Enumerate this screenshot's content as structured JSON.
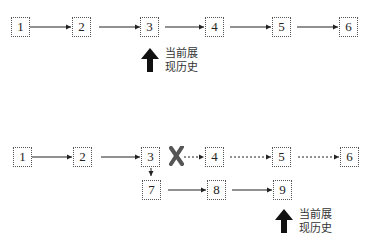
{
  "diagram": {
    "top_row": {
      "nodes": [
        "1",
        "2",
        "3",
        "4",
        "5",
        "6"
      ],
      "current_marker": {
        "node": "3",
        "label_line1": "当前展",
        "label_line2": "现历史"
      }
    },
    "bottom_section": {
      "main_row_nodes": [
        "1",
        "2",
        "3",
        "4",
        "5",
        "6"
      ],
      "discarded_nodes": [
        "4",
        "5",
        "6"
      ],
      "branch_nodes": [
        "7",
        "8",
        "9"
      ],
      "current_marker": {
        "node": "9",
        "label_line1": "当前展",
        "label_line2": "现历史"
      }
    },
    "colors": {
      "line": "#222222",
      "box_border": "#555555",
      "cross": "#555555"
    }
  }
}
